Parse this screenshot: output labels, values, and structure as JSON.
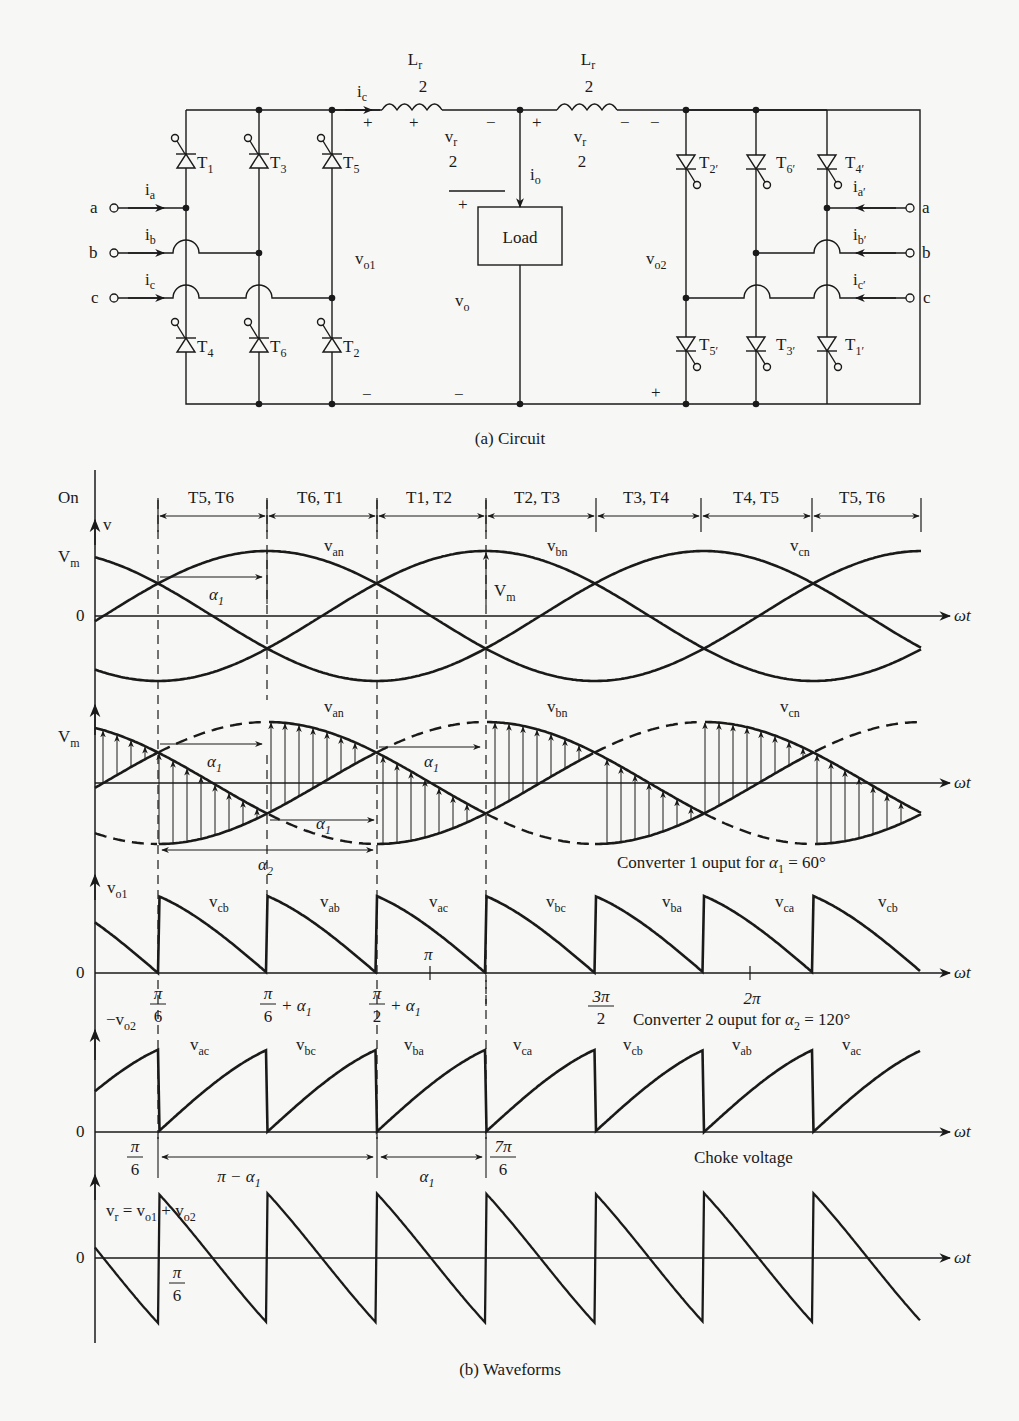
{
  "figure": {
    "circuit_caption": "(a) Circuit",
    "waveforms_caption": "(b) Waveforms"
  },
  "circuit": {
    "inputs_left": [
      {
        "phase": "a",
        "current": "i",
        "current_sub": "a"
      },
      {
        "phase": "b",
        "current": "i",
        "current_sub": "b"
      },
      {
        "phase": "c",
        "current": "i",
        "current_sub": "c"
      }
    ],
    "inputs_right": [
      {
        "phase": "a",
        "current": "i",
        "current_sub": "a′"
      },
      {
        "phase": "b",
        "current": "i",
        "current_sub": "b′"
      },
      {
        "phase": "c",
        "current": "i",
        "current_sub": "c′"
      }
    ],
    "thyristors_left_top": [
      {
        "name": "T",
        "sub": "1"
      },
      {
        "name": "T",
        "sub": "3"
      },
      {
        "name": "T",
        "sub": "5"
      }
    ],
    "thyristors_left_bottom": [
      {
        "name": "T",
        "sub": "4"
      },
      {
        "name": "T",
        "sub": "6"
      },
      {
        "name": "T",
        "sub": "2"
      }
    ],
    "thyristors_right_top": [
      {
        "name": "T",
        "sub": "2′"
      },
      {
        "name": "T",
        "sub": "6′"
      },
      {
        "name": "T",
        "sub": "4′"
      }
    ],
    "thyristors_right_bottom": [
      {
        "name": "T",
        "sub": "5′"
      },
      {
        "name": "T",
        "sub": "3′"
      },
      {
        "name": "T",
        "sub": "1′"
      }
    ],
    "inductor_label": {
      "num": "L",
      "num_sub": "r",
      "den": "2"
    },
    "inductor_voltage": {
      "num": "v",
      "num_sub": "r",
      "den": "2"
    },
    "top_current": {
      "name": "i",
      "sub": "c"
    },
    "load_current": {
      "name": "i",
      "sub": "o"
    },
    "load_label": "Load",
    "vo1": {
      "name": "v",
      "sub": "o1"
    },
    "vo2": {
      "name": "v",
      "sub": "o2"
    },
    "vo": {
      "name": "v",
      "sub": "o"
    },
    "plus": "+",
    "minus": "−"
  },
  "chart_data": [
    {
      "type": "line",
      "title": "Phase voltages with conduction intervals",
      "ylabel": "v",
      "xlabel": "ωt",
      "y_ticks": [
        "0",
        "V_m"
      ],
      "axis_top_label": "On",
      "conduction_intervals": [
        "T5, T6",
        "T6, T1",
        "T1, T2",
        "T2, T3",
        "T3, T4",
        "T4, T5",
        "T5, T6"
      ],
      "series": [
        {
          "name": "v_an",
          "amplitude": "V_m",
          "phase_deg": 0
        },
        {
          "name": "v_bn",
          "amplitude": "V_m",
          "phase_deg": -120
        },
        {
          "name": "v_cn",
          "amplitude": "V_m",
          "phase_deg": 120
        }
      ],
      "annotations": [
        "α1",
        "V_m"
      ]
    },
    {
      "type": "line",
      "title": "Converter 1 ouput for α1 = 60°",
      "ylabel": "",
      "xlabel": "ωt",
      "y_ticks": [
        "V_m"
      ],
      "series": [
        {
          "name": "v_an"
        },
        {
          "name": "v_bn"
        },
        {
          "name": "v_cn"
        }
      ],
      "annotations": [
        "α1",
        "α1",
        "α1",
        "α2"
      ],
      "alpha1_deg": 60
    },
    {
      "type": "line",
      "title": "v_o1",
      "xlabel": "ωt",
      "y_ticks": [
        "0"
      ],
      "segment_labels": [
        "v_cb",
        "v_ab",
        "v_ac",
        "v_bc",
        "v_ba",
        "v_ca",
        "v_cb"
      ],
      "x_ticks": [
        "π/6",
        "π/6 + α1",
        "π/2 + α1",
        "π",
        "3π/2",
        "2π"
      ]
    },
    {
      "type": "line",
      "title": "Converter 2 ouput for α2 = 120°",
      "ylabel": "−v_o2",
      "xlabel": "ωt",
      "y_ticks": [
        "0"
      ],
      "alpha2_deg": 120,
      "segment_labels": [
        "v_ac",
        "v_bc",
        "v_ba",
        "v_ca",
        "v_cb",
        "v_ab",
        "v_ac"
      ],
      "x_ticks": [
        "π/6",
        "7π/6"
      ],
      "dimension_labels": [
        "π − α1",
        "α1"
      ]
    },
    {
      "type": "line",
      "title": "Choke voltage",
      "ylabel": "v_r = v_o1 + v_o2",
      "xlabel": "ωt",
      "y_ticks": [
        "0"
      ],
      "x_ticks": [
        "π/6"
      ]
    }
  ],
  "labels": {
    "on": "On",
    "v": "v",
    "Vm": "V",
    "Vm_sub": "m",
    "zero": "0",
    "wt": "ωt",
    "van": "an",
    "vbn": "bn",
    "vcn": "cn",
    "alpha": "α",
    "conv1_title": "Converter 1 ouput for ",
    "conv1_alpha": "α",
    "conv1_value": " = 60°",
    "conv2_title": "Converter 2 ouput for ",
    "conv2_value": " = 120°",
    "choke_title": "Choke voltage",
    "vo1_label": "o1",
    "vo2_label": "o2",
    "neg_v": "−v",
    "vr_eq": "= v",
    "vr_plus": "+ v",
    "pi": "π",
    "pi6_num": "π",
    "pi6_den": "6",
    "pi2_den": "2",
    "plus_alpha": "+ α",
    "three_pi": "3π",
    "two_pi": "2π",
    "seven_pi": "7π",
    "pi_minus_alpha": "π − α"
  }
}
